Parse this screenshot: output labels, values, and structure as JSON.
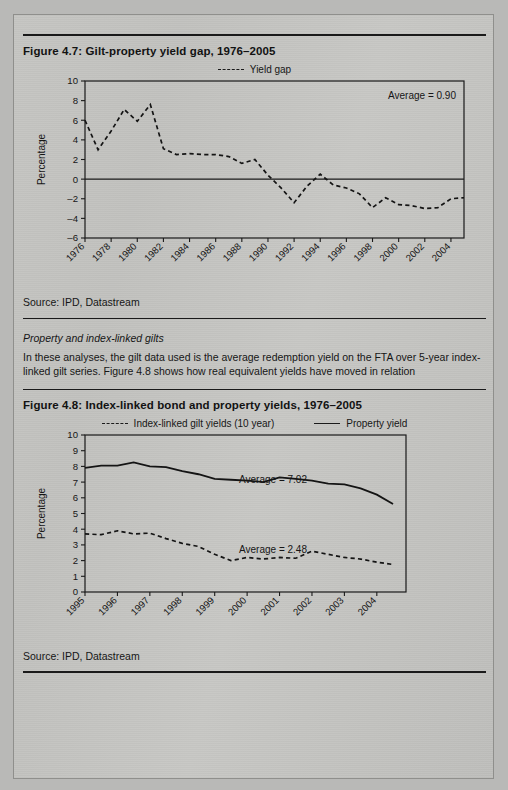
{
  "page": {
    "background_color": "#c4c4c1",
    "ink_color": "#161616"
  },
  "figure_1": {
    "title": "Figure 4.7:  Gilt-property yield gap, 1976–2005",
    "source": "Source: IPD, Datastream",
    "legend": [
      {
        "label": "Yield gap",
        "style": "dashed"
      }
    ],
    "annotation": "Average = 0.90"
  },
  "interlude": {
    "heading": "Property and index-linked gilts",
    "paragraph": "In these analyses, the gilt data used is the average redemption yield on the FTA over 5-year index-linked gilt series. Figure 4.8 shows how real equivalent yields have moved in relation"
  },
  "figure_2": {
    "title": "Figure 4.8:  Index-linked bond and property yields, 1976–2005",
    "source": "Source: IPD, Datastream",
    "legend": [
      {
        "label": "Index-linked gilt yields (10 year)",
        "style": "dashed"
      },
      {
        "label": "Property yield",
        "style": "solid"
      }
    ],
    "annotation_property": "Average = 7.02",
    "annotation_gilt": "Average = 2.48"
  },
  "chart_data": [
    {
      "type": "line",
      "title": "Gilt-property yield gap, 1976–2005",
      "xlabel": "",
      "ylabel": "Percentage",
      "ylim": [
        -6,
        10
      ],
      "yticks": [
        -6,
        -4,
        -2,
        0,
        2,
        4,
        6,
        8,
        10
      ],
      "xticklabels": [
        "1976",
        "1978",
        "1980",
        "1982",
        "1984",
        "1986",
        "1988",
        "1990",
        "1992",
        "1994",
        "1996",
        "1998",
        "2000",
        "2002",
        "2004"
      ],
      "grid": false,
      "legend_position": "top-center",
      "annotations": [
        {
          "text": "Average = 0.90",
          "position": "top-right"
        }
      ],
      "series": [
        {
          "name": "Yield gap",
          "style": "dashed",
          "x": [
            1976,
            1977,
            1978,
            1979,
            1980,
            1981,
            1982,
            1983,
            1984,
            1985,
            1986,
            1987,
            1988,
            1989,
            1990,
            1991,
            1992,
            1993,
            1994,
            1995,
            1996,
            1997,
            1998,
            1999,
            2000,
            2001,
            2002,
            2003,
            2004,
            2005
          ],
          "values": [
            6.0,
            3.0,
            4.9,
            7.1,
            5.9,
            7.6,
            3.1,
            2.5,
            2.6,
            2.5,
            2.5,
            2.3,
            1.6,
            2.0,
            0.4,
            -0.9,
            -2.4,
            -0.7,
            0.5,
            -0.6,
            -0.9,
            -1.5,
            -2.9,
            -1.9,
            -2.6,
            -2.7,
            -3.0,
            -2.9,
            -2.0,
            -1.9
          ]
        }
      ]
    },
    {
      "type": "line",
      "title": "Index-linked bond and property yields, 1976–2005",
      "xlabel": "",
      "ylabel": "Percentage",
      "ylim": [
        0,
        10
      ],
      "yticks": [
        0,
        1,
        2,
        3,
        4,
        5,
        6,
        7,
        8,
        9,
        10
      ],
      "xticklabels": [
        "1995",
        "1996",
        "1997",
        "1998",
        "1999",
        "2000",
        "2001",
        "2002",
        "2003",
        "2004"
      ],
      "grid": false,
      "legend_position": "top-center",
      "annotations": [
        {
          "text": "Average = 7.02",
          "position": "upper-middle"
        },
        {
          "text": "Average = 2.48",
          "position": "lower-middle"
        }
      ],
      "series": [
        {
          "name": "Property yield",
          "style": "solid",
          "x": [
            1995.0,
            1995.5,
            1996.0,
            1996.5,
            1997.0,
            1997.5,
            1998.0,
            1998.5,
            1999.0,
            1999.5,
            2000.0,
            2000.5,
            2001.0,
            2001.5,
            2002.0,
            2002.5,
            2003.0,
            2003.5,
            2004.0,
            2004.5
          ],
          "values": [
            7.9,
            8.05,
            8.05,
            8.25,
            8.0,
            7.95,
            7.7,
            7.5,
            7.2,
            7.15,
            7.1,
            7.0,
            7.3,
            7.2,
            7.1,
            6.9,
            6.85,
            6.6,
            6.2,
            5.6
          ]
        },
        {
          "name": "Index-linked gilt yields (10 year)",
          "style": "dashed",
          "x": [
            1995.0,
            1995.5,
            1996.0,
            1996.5,
            1997.0,
            1997.5,
            1998.0,
            1998.5,
            1999.0,
            1999.5,
            2000.0,
            2000.5,
            2001.0,
            2001.5,
            2002.0,
            2002.5,
            2003.0,
            2003.5,
            2004.0,
            2004.5
          ],
          "values": [
            3.7,
            3.65,
            3.9,
            3.7,
            3.75,
            3.4,
            3.1,
            2.9,
            2.4,
            2.0,
            2.2,
            2.1,
            2.2,
            2.15,
            2.6,
            2.4,
            2.2,
            2.1,
            1.9,
            1.75
          ]
        }
      ]
    }
  ]
}
